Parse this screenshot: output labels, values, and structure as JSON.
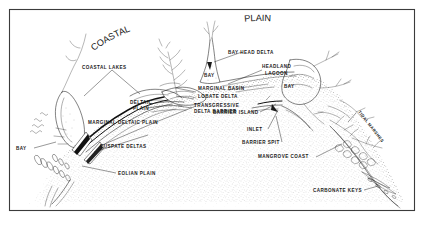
{
  "figure": {
    "title_words": [
      {
        "text": "COASTAL",
        "id": "coastal"
      },
      {
        "text": "PLAIN",
        "id": "plain"
      }
    ],
    "border_color": "#3b3b3b",
    "background_color": "#ffffff",
    "ink_color": "#1b1b1b",
    "stipple_color": "#555555"
  },
  "labels": {
    "coastal_lakes": "COASTAL LAKES",
    "deltaic_plain_line1": "DELTAIC",
    "deltaic_plain_line2": "PLAIN",
    "marginal_deltaic_plain": "MARGINAL DELTAIC PLAIN",
    "cuspate_deltas": "CUSPATE DELTAS",
    "bay_left": "BAY",
    "eolian_plain": "EOLIAN PLAIN",
    "marginal_basin": "MARGINAL BASIN",
    "lobate_delta": "LOBATE DELTA",
    "transgressive_delta_barrier_line1": "TRANSGRESSIVE",
    "transgressive_delta_barrier_line2": "DELTA BARRIER",
    "bay_head_delta": "BAY HEAD DELTA",
    "bay_center": "BAY",
    "headland_line1": "HEADLAND",
    "headland_line2": "LAGOON",
    "bay_right": "BAY",
    "barrier_island": "BARRIER ISLAND",
    "inlet": "INLET",
    "barrier_spit": "BARRIER SPIT",
    "mangrove_coast": "MANGROVE COAST",
    "tidal_marshes": "TIDAL MARSHES",
    "carbonate_keys": "CARBONATE KEYS"
  }
}
